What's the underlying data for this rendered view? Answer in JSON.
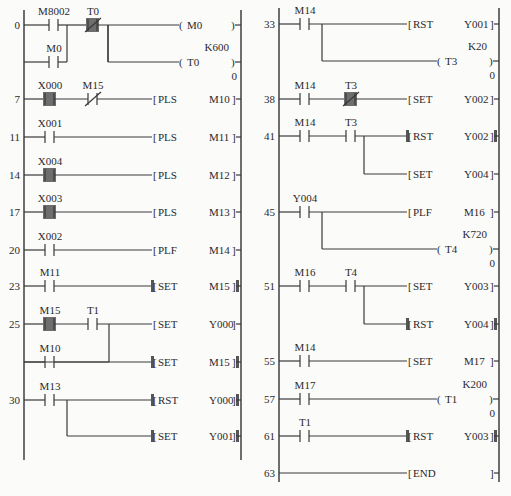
{
  "diagram_type": "plc-ladder-diagram",
  "colors": {
    "line": "#3a3a3a",
    "highlight": "#6e6e6e",
    "background": "#fbfbfa",
    "text": "#2a2a2a"
  },
  "columns": [
    {
      "left_rail_x": 24,
      "right_rail_x": 241,
      "rail_top": 10,
      "rail_bottom": 460,
      "rungs": [
        {
          "step": "0",
          "y": 25,
          "contacts": [
            {
              "label": "M8002",
              "x": 48,
              "type": "NO",
              "active": false
            },
            {
              "label": "T0",
              "x": 87,
              "type": "NC",
              "active": true
            }
          ],
          "branch_contacts": [
            {
              "label": "M0",
              "x": 48,
              "y": 62,
              "type": "NO",
              "active": false
            }
          ],
          "join_x": 67,
          "outputs": [
            {
              "kind": "coil",
              "y": 25,
              "instr": "M0",
              "start_x": 108
            },
            {
              "kind": "coil",
              "y": 62,
              "instr": "T0",
              "const": "K600",
              "current": "0",
              "start_x": 108
            }
          ]
        },
        {
          "step": "7",
          "y": 99,
          "contacts": [
            {
              "label": "X000",
              "x": 44,
              "type": "NO",
              "active": true
            },
            {
              "label": "M15",
              "x": 87,
              "type": "NC",
              "active": false
            }
          ],
          "outputs": [
            {
              "kind": "func",
              "y": 99,
              "instr": "PLS",
              "operand": "M10"
            }
          ]
        },
        {
          "step": "11",
          "y": 137,
          "contacts": [
            {
              "label": "X001",
              "x": 44,
              "type": "NO",
              "active": false
            }
          ],
          "outputs": [
            {
              "kind": "func",
              "y": 137,
              "instr": "PLS",
              "operand": "M11"
            }
          ]
        },
        {
          "step": "14",
          "y": 175,
          "contacts": [
            {
              "label": "X004",
              "x": 44,
              "type": "NO",
              "active": true
            }
          ],
          "outputs": [
            {
              "kind": "func",
              "y": 175,
              "instr": "PLS",
              "operand": "M12"
            }
          ]
        },
        {
          "step": "17",
          "y": 212,
          "contacts": [
            {
              "label": "X003",
              "x": 44,
              "type": "NO",
              "active": true
            }
          ],
          "outputs": [
            {
              "kind": "func",
              "y": 212,
              "instr": "PLS",
              "operand": "M13"
            }
          ]
        },
        {
          "step": "20",
          "y": 250,
          "contacts": [
            {
              "label": "X002",
              "x": 44,
              "type": "NO",
              "active": false
            }
          ],
          "outputs": [
            {
              "kind": "func",
              "y": 250,
              "instr": "PLF",
              "operand": "M14"
            }
          ]
        },
        {
          "step": "23",
          "y": 286,
          "contacts": [
            {
              "label": "M11",
              "x": 44,
              "type": "NO",
              "active": false
            }
          ],
          "outputs": [
            {
              "kind": "func",
              "y": 286,
              "instr": "SET",
              "operand": "M15",
              "active": true
            }
          ]
        },
        {
          "step": "25",
          "y": 324,
          "contacts": [
            {
              "label": "M15",
              "x": 44,
              "type": "NO",
              "active": true
            },
            {
              "label": "T1",
              "x": 87,
              "type": "NO",
              "active": false
            }
          ],
          "branch_contacts": [
            {
              "label": "M10",
              "x": 44,
              "y": 362,
              "type": "NO",
              "active": false
            }
          ],
          "join_x": 109,
          "outputs": [
            {
              "kind": "func",
              "y": 324,
              "instr": "SET",
              "operand": "Y000"
            },
            {
              "kind": "func",
              "y": 362,
              "instr": "SET",
              "operand": "M15",
              "active": true,
              "start_x": 24
            }
          ]
        },
        {
          "step": "30",
          "y": 400,
          "contacts": [
            {
              "label": "M13",
              "x": 44,
              "type": "NO",
              "active": false
            }
          ],
          "split_x": 67,
          "outputs": [
            {
              "kind": "func",
              "y": 400,
              "instr": "RST",
              "operand": "Y000",
              "active": true
            },
            {
              "kind": "func",
              "y": 436,
              "instr": "SET",
              "operand": "Y001",
              "active": true,
              "start_x": 67
            }
          ]
        }
      ]
    },
    {
      "left_rail_x": 279,
      "right_rail_x": 499,
      "rail_top": 8,
      "rail_bottom": 482,
      "rungs": [
        {
          "step": "33",
          "y": 24,
          "contacts": [
            {
              "label": "M14",
              "x": 299,
              "type": "NO",
              "active": false
            }
          ],
          "split_x": 322,
          "outputs": [
            {
              "kind": "func",
              "y": 24,
              "instr": "RST",
              "operand": "Y001"
            },
            {
              "kind": "coil",
              "y": 61,
              "instr": "T3",
              "const": "K20",
              "current": "0",
              "start_x": 322
            }
          ]
        },
        {
          "step": "38",
          "y": 99,
          "contacts": [
            {
              "label": "M14",
              "x": 299,
              "type": "NO",
              "active": false
            },
            {
              "label": "T3",
              "x": 345,
              "type": "NC",
              "active": true
            }
          ],
          "outputs": [
            {
              "kind": "func",
              "y": 99,
              "instr": "SET",
              "operand": "Y002"
            }
          ]
        },
        {
          "step": "41",
          "y": 136,
          "contacts": [
            {
              "label": "M14",
              "x": 299,
              "type": "NO",
              "active": false
            },
            {
              "label": "T3",
              "x": 345,
              "type": "NO",
              "active": false
            }
          ],
          "split_x": 364,
          "outputs": [
            {
              "kind": "func",
              "y": 136,
              "instr": "RST",
              "operand": "Y002",
              "active": true
            },
            {
              "kind": "func",
              "y": 174,
              "instr": "SET",
              "operand": "Y004",
              "start_x": 364
            }
          ]
        },
        {
          "step": "45",
          "y": 212,
          "contacts": [
            {
              "label": "Y004",
              "x": 299,
              "type": "NO",
              "active": false
            }
          ],
          "split_x": 322,
          "outputs": [
            {
              "kind": "func",
              "y": 212,
              "instr": "PLF",
              "operand": "M16"
            },
            {
              "kind": "coil",
              "y": 249,
              "instr": "T4",
              "const": "K720",
              "current": "0",
              "start_x": 322
            }
          ]
        },
        {
          "step": "51",
          "y": 286,
          "contacts": [
            {
              "label": "M16",
              "x": 299,
              "type": "NO",
              "active": false
            },
            {
              "label": "T4",
              "x": 345,
              "type": "NO",
              "active": false
            }
          ],
          "split_x": 364,
          "outputs": [
            {
              "kind": "func",
              "y": 286,
              "instr": "SET",
              "operand": "Y003"
            },
            {
              "kind": "func",
              "y": 324,
              "instr": "RST",
              "operand": "Y004",
              "active": true,
              "start_x": 364
            }
          ]
        },
        {
          "step": "55",
          "y": 361,
          "contacts": [
            {
              "label": "M14",
              "x": 299,
              "type": "NO",
              "active": false
            }
          ],
          "outputs": [
            {
              "kind": "func",
              "y": 361,
              "instr": "SET",
              "operand": "M17"
            }
          ]
        },
        {
          "step": "57",
          "y": 399,
          "contacts": [
            {
              "label": "M17",
              "x": 299,
              "type": "NO",
              "active": false
            }
          ],
          "outputs": [
            {
              "kind": "coil",
              "y": 399,
              "instr": "T1",
              "const": "K200",
              "current": "0"
            }
          ]
        },
        {
          "step": "61",
          "y": 436,
          "contacts": [
            {
              "label": "T1",
              "x": 299,
              "type": "NO",
              "active": false
            }
          ],
          "outputs": [
            {
              "kind": "func",
              "y": 436,
              "instr": "RST",
              "operand": "Y003",
              "active": true
            }
          ]
        },
        {
          "step": "63",
          "y": 473,
          "contacts": [],
          "outputs": [
            {
              "kind": "func",
              "y": 473,
              "instr": "END",
              "operand": "",
              "end": true
            }
          ]
        }
      ]
    }
  ]
}
